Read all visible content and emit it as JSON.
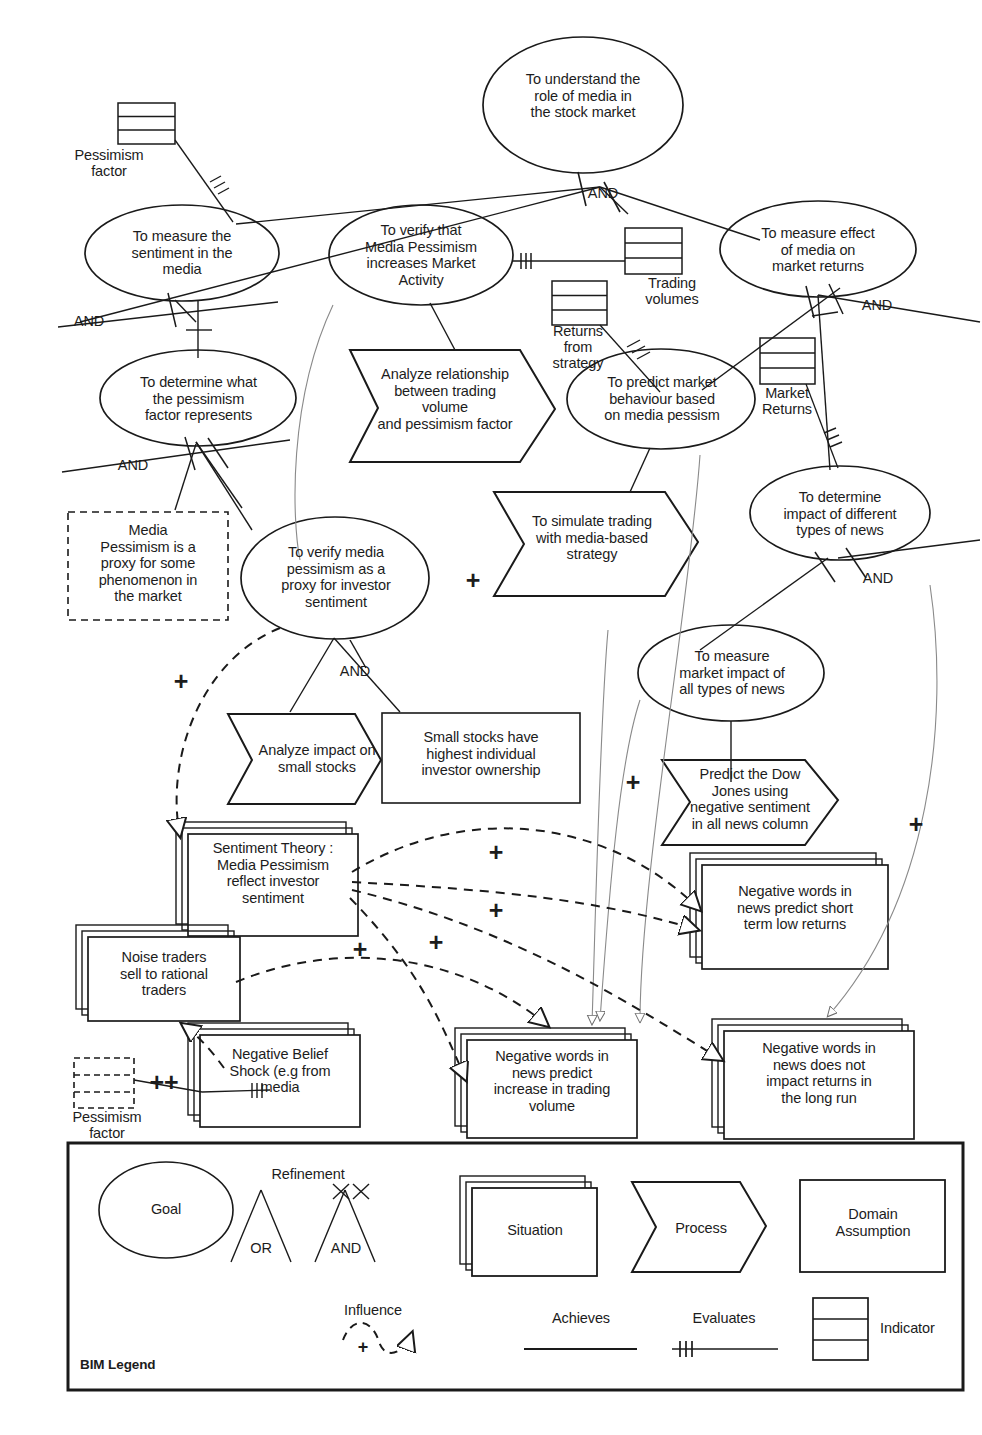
{
  "diagram": {
    "goals": [
      {
        "id": "g-understand-role",
        "text": "To  understand the\nrole of media in\nthe stock market"
      },
      {
        "id": "g-measure-sentiment",
        "text": "To measure the\nsentiment in the\nmedia"
      },
      {
        "id": "g-verify-media-pessimism-activity",
        "text": "To verify that\nMedia Pessimism\nincreases Market\nActivity"
      },
      {
        "id": "g-measure-effect-returns",
        "text": "To measure effect\nof media on\nmarket returns"
      },
      {
        "id": "g-determine-pessimism-factor",
        "text": "To determine what\nthe pessimism\nfactor represents"
      },
      {
        "id": "g-predict-market-behaviour",
        "text": "To predict market\nbehaviour based\non media pessism"
      },
      {
        "id": "g-determine-impact-news-types",
        "text": "To determine\nimpact of different\ntypes of news"
      },
      {
        "id": "g-verify-proxy-investor-sentiment",
        "text": "To verify media\npessimism as a\nproxy for investor\nsentiment"
      },
      {
        "id": "g-measure-market-impact-news",
        "text": "To measure\nmarket impact of\nall types of news"
      }
    ],
    "processes": [
      {
        "id": "p-analyze-relationship",
        "text": "Analyze relationship\nbetween trading\nvolume\nand pessimism factor"
      },
      {
        "id": "p-simulate-trading",
        "text": "To simulate trading\nwith media-based\nstrategy"
      },
      {
        "id": "p-analyze-small-stocks",
        "text": "Analyze impact  on\nsmall stocks"
      },
      {
        "id": "p-predict-dow-jones",
        "text": "Predict the Dow\nJones using\nnegative sentiment\nin all news column"
      }
    ],
    "situations": [
      {
        "id": "s-small-stocks-ownership",
        "text": "Small stocks have\nhighest individual\ninvestor ownership"
      },
      {
        "id": "s-sentiment-theory",
        "text": "Sentiment Theory :\nMedia Pessimism\nreflect investor\nsentiment"
      },
      {
        "id": "s-noise-traders",
        "text": "Noise traders\nsell to rational\ntraders"
      },
      {
        "id": "s-negative-belief-shock",
        "text": "Negative Belief\nShock (e.g from\nmedia"
      },
      {
        "id": "s-negwords-trading-volume",
        "text": "Negative words in\nnews predict\nincrease in trading\nvolume"
      },
      {
        "id": "s-negwords-short-term",
        "text": "Negative words in\nnews predict short\nterm low returns"
      },
      {
        "id": "s-negwords-long-run",
        "text": "Negative words in\nnews does not\nimpact returns in\nthe long run"
      }
    ],
    "domain_assumptions": [
      {
        "id": "d-media-pessimism-proxy",
        "text": "Media\nPessimism is a\nproxy for some\nphenomenon in\nthe market"
      }
    ],
    "indicators": [
      {
        "id": "i-pessimism-factor-top",
        "text": "Pessimism\nfactor"
      },
      {
        "id": "i-trading-volumes",
        "text": "Trading\nvolumes"
      },
      {
        "id": "i-returns-from-strategy",
        "text": "Returns\nfrom\nstrategy"
      },
      {
        "id": "i-market-returns",
        "text": "Market\nReturns"
      },
      {
        "id": "i-pessimism-factor-bottom",
        "text": "Pessimism\nfactor"
      }
    ],
    "refinement_labels": [
      {
        "id": "and-1",
        "text": "AND"
      },
      {
        "id": "and-2",
        "text": "AND"
      },
      {
        "id": "and-3",
        "text": "AND"
      },
      {
        "id": "and-4",
        "text": "AND"
      },
      {
        "id": "and-5",
        "text": "AND"
      },
      {
        "id": "and-6",
        "text": "AND"
      }
    ],
    "influence_marks": [
      {
        "id": "plus-1",
        "text": "+"
      },
      {
        "id": "plus-2",
        "text": "+"
      },
      {
        "id": "plus-3",
        "text": "+"
      },
      {
        "id": "plus-4",
        "text": "+"
      },
      {
        "id": "plus-5",
        "text": "+"
      },
      {
        "id": "plus-6",
        "text": "+"
      },
      {
        "id": "plus-7",
        "text": "+"
      },
      {
        "id": "plus-8",
        "text": "+"
      },
      {
        "id": "plus-double",
        "text": "++"
      }
    ]
  },
  "legend": {
    "title": "BIM Legend",
    "goal": "Goal",
    "refinement": "Refinement",
    "or": "OR",
    "and": "AND",
    "situation": "Situation",
    "process": "Process",
    "domain_assumption": "Domain\nAssumption",
    "influence": "Influence",
    "influence_sign": "+",
    "achieves": "Achieves",
    "evaluates": "Evaluates",
    "indicator": "Indicator"
  },
  "colors": {
    "stroke": "#1a1a1a",
    "background": "#ffffff",
    "text": "#1c1c1c"
  }
}
